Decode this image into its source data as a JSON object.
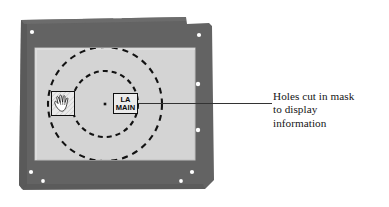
{
  "figure": {
    "type": "technical-illustration"
  },
  "colors": {
    "background": "#ffffff",
    "frame_dark_gray": "#636363",
    "frame_edge_shadow": "#4f4f4f",
    "panel_light_gray": "#d4d4d4",
    "panel_edge": "#c2c2c2",
    "hole_marker": "#ffffff",
    "ink_black": "#111111",
    "label_fill": "#ebebeb",
    "leader_line": "#333333",
    "caption_text": "#151515"
  },
  "plate": {
    "name": "mask-plate",
    "description": "dark gray rectangular mask plate with notched top-right corner",
    "x": 16,
    "y": 16,
    "width": 200,
    "height": 174,
    "mounting_holes": [
      {
        "name": "hole-top-left",
        "cx": 32,
        "cy": 32
      },
      {
        "name": "hole-top-right",
        "cx": 199,
        "cy": 35
      },
      {
        "name": "hole-right-upper",
        "cx": 198,
        "cy": 84
      },
      {
        "name": "hole-right-lower",
        "cx": 198,
        "cy": 130
      },
      {
        "name": "hole-bottom-left",
        "cx": 31,
        "cy": 172
      },
      {
        "name": "hole-bottom-left-inner",
        "cx": 43,
        "cy": 181
      },
      {
        "name": "hole-bottom-right",
        "cx": 192,
        "cy": 172
      },
      {
        "name": "hole-bottom-right-inner",
        "cx": 181,
        "cy": 181
      }
    ],
    "top_notches": [
      {
        "name": "notch-top-a",
        "cx": 78,
        "cy": 17
      },
      {
        "name": "notch-top-b",
        "cx": 117,
        "cy": 17
      }
    ]
  },
  "window_panel": {
    "name": "display-window",
    "description": "light gray display area seen through the mask",
    "x": 35,
    "y": 48,
    "width": 160,
    "height": 112
  },
  "dashed_circles": [
    {
      "name": "outer-dashed-circle",
      "cx": 105,
      "cy": 104,
      "r": 57,
      "dash": "6 5"
    },
    {
      "name": "inner-dashed-circle",
      "cx": 105,
      "cy": 104,
      "r": 33,
      "dash": "5 4"
    }
  ],
  "center_marker": {
    "name": "center-point-marker",
    "cx": 105,
    "cy": 104,
    "size": 2.6
  },
  "labels": {
    "la_main": {
      "name": "la-main-hole-label",
      "line1": "LA",
      "line2": "MAIN"
    },
    "hand": {
      "name": "hand-pictogram-hole",
      "icon": "hand-icon",
      "alt": "hand pictogram"
    }
  },
  "leader": {
    "name": "leader-line",
    "x1": 138,
    "y1": 103.5,
    "x2": 272,
    "y2": 103.5
  },
  "caption": {
    "name": "caption-holes-cut-in-mask",
    "lines": [
      "Holes cut in mask",
      "to display",
      "information"
    ],
    "line1": "Holes cut in mask",
    "line2": "to display",
    "line3": "information"
  }
}
